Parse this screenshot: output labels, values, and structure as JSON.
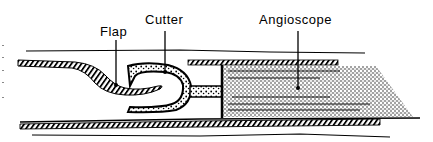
{
  "diagram": {
    "type": "medical-device-cross-section",
    "labels": {
      "flap": "Flap",
      "cutter": "Cutter",
      "angioscope": "Angioscope"
    },
    "colors": {
      "ink": "#000000",
      "background": "#ffffff"
    }
  }
}
